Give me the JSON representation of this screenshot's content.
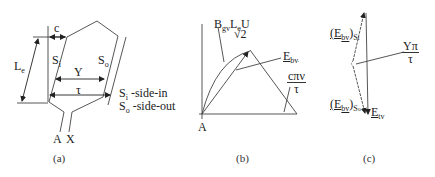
{
  "figure": {
    "panels": [
      {
        "id": "a",
        "caption": "(a)",
        "labels": {
          "c": "c",
          "Le_main": "L",
          "Le_sub": "e",
          "Si_main": "S",
          "Si_sub": "i",
          "So_main": "S",
          "So_sub": "o",
          "Y": "Y",
          "tau": "τ",
          "A": "A",
          "X": "X"
        },
        "legend": [
          {
            "main": "S",
            "sub": "i",
            "text": " -side-in"
          },
          {
            "main": "S",
            "sub": "o",
            "text": " -side-out"
          }
        ]
      },
      {
        "id": "b",
        "caption": "(b)",
        "labels": {
          "phasor_B": "B",
          "phasor_B_sub": "gv",
          "phasor_L": "L",
          "phasor_L_sub": "e",
          "phasor_U": "U",
          "sqrt2": "√2",
          "Ebv_main": "E",
          "Ebv_sub": "bv",
          "angle_num": "cπν",
          "angle_den": "τ",
          "A": "A"
        }
      },
      {
        "id": "c",
        "caption": "(c)",
        "labels": {
          "EbvSi_main": "(E",
          "EbvSi_sub": "bv",
          "EbvSi_close": ")",
          "EbvSi_s": "S",
          "EbvSi_ss": "i",
          "EbvSo_main": "(E",
          "EbvSo_sub": "bv",
          "EbvSo_close": ")",
          "EbvSo_s": "S",
          "EbvSo_ss": "o",
          "Etv_main": "E",
          "Etv_sub": "tv",
          "angle_num": "Yπ",
          "angle_den": "τ"
        }
      }
    ],
    "colors": {
      "line": "#444444",
      "background": "#ffffff"
    }
  }
}
